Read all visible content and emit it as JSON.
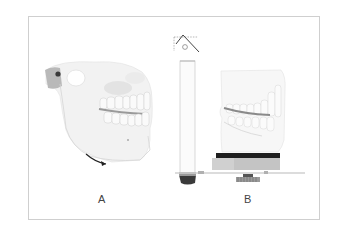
{
  "figure": {
    "panels": [
      {
        "id": "A",
        "label": "A",
        "description": "skull-lateral-view-with-mandible-rotation-arrow"
      },
      {
        "id": "B",
        "label": "B",
        "description": "articulator-with-dental-casts"
      }
    ]
  },
  "colors": {
    "border": "#cfcfcf",
    "bone": "#f1f1f1",
    "bone_shadow": "#d9d9d9",
    "dark": "#2a2a2a",
    "label": "#444444"
  }
}
